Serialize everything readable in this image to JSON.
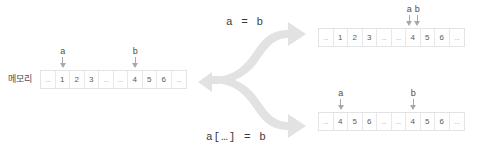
{
  "diagram": {
    "arrow_color": "#e2e2e2",
    "cell_text_color": "#5a5a5a",
    "pointer_color": "#a8a8a8"
  },
  "memory_label": "메모리",
  "source": {
    "name": "source-array",
    "cells": [
      "...",
      "1",
      "2",
      "3",
      "...",
      "...",
      "4",
      "5",
      "6",
      "..."
    ],
    "pointers": [
      {
        "label": "a",
        "cell_index": 1
      },
      {
        "label": "b",
        "cell_index": 6
      }
    ]
  },
  "branches": [
    {
      "id": "reference-assignment",
      "label": "a  =  b",
      "result": {
        "name": "result-array-top",
        "cells": [
          "...",
          "1",
          "2",
          "3",
          "...",
          "...",
          "4",
          "5",
          "6",
          "..."
        ],
        "pointers": [
          {
            "label": "a",
            "cell_index": 6
          },
          {
            "label": "b",
            "cell_index": 6
          }
        ]
      }
    },
    {
      "id": "slice-assignment",
      "label": "a[…]  =  b",
      "result": {
        "name": "result-array-bottom",
        "cells": [
          "...",
          "4",
          "5",
          "6",
          "...",
          "...",
          "4",
          "5",
          "6",
          "..."
        ],
        "pointers": [
          {
            "label": "a",
            "cell_index": 1
          },
          {
            "label": "b",
            "cell_index": 6
          }
        ]
      }
    }
  ]
}
